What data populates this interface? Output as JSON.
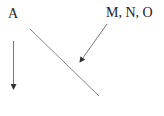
{
  "labels": {
    "left": "A",
    "right": "M, N, O"
  },
  "colors": {
    "text": "#222222",
    "stroke": "#777777",
    "arrowhead": "#333333"
  }
}
